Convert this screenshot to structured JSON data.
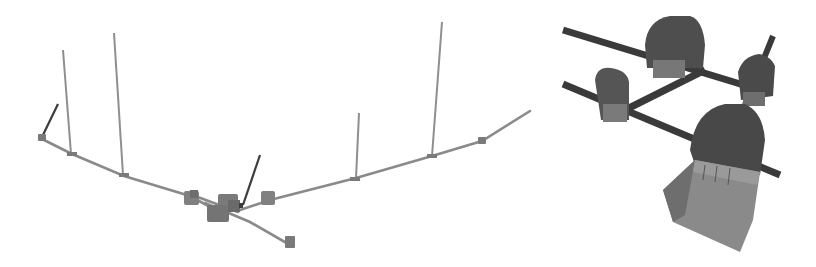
{
  "figure": {
    "panels": [
      {
        "id": "left",
        "description": "3D overview of tunnel network with vertical shafts",
        "view": "overview"
      },
      {
        "id": "right",
        "description": "3D close-up of tunnel chambers and junction",
        "view": "detail"
      }
    ],
    "colors": {
      "background": "#ffffff",
      "pipe": "#8a8a8a",
      "shaft": "#8f8f8f",
      "inclined_shaft": "#3c3c3c",
      "node": "#7a7a7a",
      "chamber_dark": "#4a4a4a",
      "chamber_mid": "#6e6e6e",
      "chamber_light": "#9a9a9a",
      "tunnel_dark": "#3a3a3a"
    }
  }
}
